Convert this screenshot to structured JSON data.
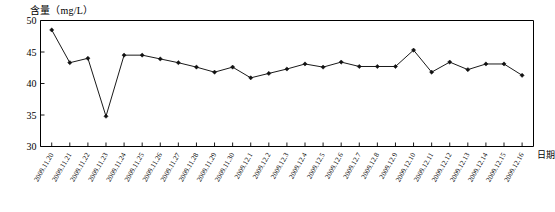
{
  "chart_data": {
    "type": "line",
    "title": "",
    "subtitle": "",
    "xlabel": "日期",
    "ylabel": "含量（mg/L）",
    "ylim": [
      30,
      50
    ],
    "y_ticks": [
      30,
      35,
      40,
      45,
      50
    ],
    "grid": false,
    "legend": null,
    "legend_position": "none",
    "marker": "filled-diamond",
    "categories": [
      "2009.11.20",
      "2009.11.21",
      "2009.11.22",
      "2009.11.23",
      "2009.11.24",
      "2009.11.25",
      "2009.11.26",
      "2009.11.27",
      "2009.11.28",
      "2009.11.29",
      "2009.11.30",
      "2009.12.1",
      "2009.12.2",
      "2009.12.3",
      "2009.12.4",
      "2009.12.5",
      "2009.12.6",
      "2009.12.7",
      "2009.12.8",
      "2009.12.9",
      "2009.12.10",
      "2009.12.11",
      "2009.12.12",
      "2009.12.13",
      "2009.12.14",
      "2009.12.15",
      "2009.12.16"
    ],
    "values": [
      48.5,
      43.3,
      44.0,
      34.8,
      44.5,
      44.5,
      43.9,
      43.3,
      42.6,
      41.8,
      42.6,
      40.9,
      41.6,
      42.3,
      43.1,
      42.6,
      43.4,
      42.7,
      42.7,
      42.7,
      45.3,
      41.8,
      43.4,
      42.2,
      43.1,
      43.1,
      41.3
    ]
  },
  "axis": {
    "x_title": "日期",
    "y_title": "含量（mg/L）"
  }
}
